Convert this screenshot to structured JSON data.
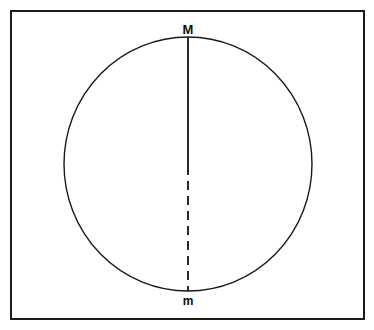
{
  "figure": {
    "background_color": "#ffffff",
    "stroke_color": "#141414",
    "frame": {
      "name": "outer-border",
      "x": 11,
      "y": 11,
      "width": 353,
      "height": 308,
      "stroke_width": 2,
      "color": "#1b1b1b"
    },
    "circle": {
      "name": "main-circle",
      "center_x": 188,
      "center_y": 164,
      "radius_x": 124,
      "radius_y": 127,
      "stroke_width": 1.4,
      "color": "#1a1a1a",
      "fill": "none"
    },
    "diameter": {
      "name": "vertical-diameter",
      "x": 188,
      "top_y": 37,
      "center_y": 166,
      "bottom_y": 291,
      "upper_segment_style": "solid",
      "lower_segment_style": "dashed",
      "dash_pattern": "9 6",
      "stroke_width": 1.8,
      "color": "#141414"
    },
    "labels": [
      {
        "name": "label-top-major",
        "text": "M",
        "x": 188,
        "y": 34,
        "font_size": 13,
        "weight": "bold",
        "color": "#0d0d0d",
        "anchor_point": "top-of-circle"
      },
      {
        "name": "label-bottom-minor",
        "text": "m",
        "x": 188,
        "y": 305,
        "font_size": 12,
        "weight": "bold",
        "color": "#0d0d0d",
        "anchor_point": "bottom-of-circle"
      }
    ]
  }
}
